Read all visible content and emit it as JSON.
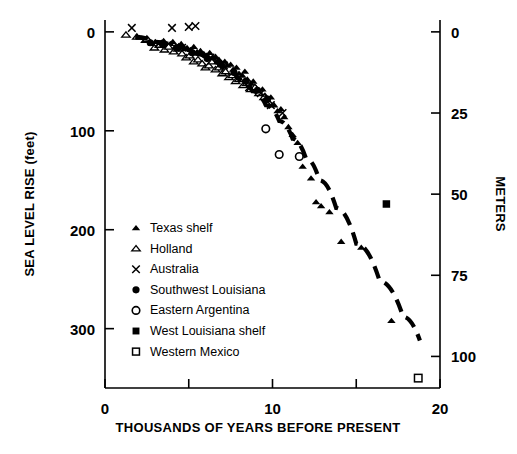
{
  "figure": {
    "left_axis_title": "SEA LEVEL RISE (feet)",
    "right_axis_title": "METERS",
    "x_axis_title": "THOUSANDS OF YEARS BEFORE PRESENT"
  },
  "legend": {
    "items": [
      {
        "label": "Texas shelf",
        "marker": "filled-triangle-icon"
      },
      {
        "label": "Holland",
        "marker": "open-triangle-icon"
      },
      {
        "label": "Australia",
        "marker": "x-cross-icon"
      },
      {
        "label": "Southwest Louisiana",
        "marker": "filled-circle-icon"
      },
      {
        "label": "Eastern Argentina",
        "marker": "open-circle-icon"
      },
      {
        "label": "West Louisiana shelf",
        "marker": "filled-square-icon"
      },
      {
        "label": "Western Mexico",
        "marker": "open-square-icon"
      }
    ]
  },
  "chart_data": {
    "type": "scatter",
    "title": "",
    "xlabel": "THOUSANDS OF YEARS BEFORE PRESENT",
    "ylabel": "SEA LEVEL RISE (feet)",
    "y2label": "METERS",
    "xlim": [
      0,
      20
    ],
    "ylim": [
      360,
      -12
    ],
    "y2lim": [
      110,
      -4
    ],
    "grid": false,
    "legend_position": "inside-lower-left",
    "x_ticks": [
      0,
      5,
      10,
      15,
      20
    ],
    "x_tick_labels": [
      "0",
      "",
      "10",
      "",
      "20"
    ],
    "y_ticks": [
      0,
      100,
      200,
      300
    ],
    "y_tick_labels": [
      "0",
      "100",
      "200",
      "300"
    ],
    "y2_ticks": [
      0,
      25,
      50,
      75,
      100
    ],
    "y2_tick_labels": [
      "0",
      "25",
      "50",
      "75",
      "100"
    ],
    "feet_per_meter": 3.2808,
    "series": [
      {
        "name": "Texas shelf",
        "marker": "filled-triangle",
        "points": [
          [
            2.05,
            6
          ],
          [
            2.35,
            9
          ],
          [
            2.6,
            8
          ],
          [
            2.8,
            12
          ],
          [
            3.0,
            10
          ],
          [
            3.2,
            14
          ],
          [
            3.35,
            11
          ],
          [
            3.5,
            9
          ],
          [
            3.7,
            13
          ],
          [
            3.9,
            12
          ],
          [
            4.05,
            10
          ],
          [
            4.2,
            15
          ],
          [
            4.4,
            14
          ],
          [
            4.55,
            12
          ],
          [
            4.75,
            17
          ],
          [
            4.9,
            16
          ],
          [
            5.1,
            18
          ],
          [
            5.3,
            15
          ],
          [
            5.5,
            20
          ],
          [
            5.7,
            19
          ],
          [
            5.9,
            22
          ],
          [
            6.05,
            24
          ],
          [
            6.25,
            21
          ],
          [
            6.45,
            26
          ],
          [
            6.6,
            25
          ],
          [
            6.8,
            28
          ],
          [
            6.95,
            31
          ],
          [
            7.15,
            30
          ],
          [
            7.3,
            34
          ],
          [
            7.5,
            33
          ],
          [
            7.65,
            38
          ],
          [
            7.85,
            36
          ],
          [
            8.0,
            42
          ],
          [
            8.2,
            44
          ],
          [
            8.35,
            40
          ],
          [
            8.5,
            48
          ],
          [
            8.7,
            52
          ],
          [
            8.85,
            50
          ],
          [
            9.0,
            56
          ],
          [
            9.2,
            60
          ],
          [
            9.4,
            58
          ],
          [
            9.55,
            64
          ],
          [
            9.75,
            70
          ],
          [
            9.9,
            66
          ],
          [
            10.1,
            74
          ],
          [
            10.3,
            80
          ],
          [
            10.5,
            78
          ],
          [
            10.7,
            86
          ],
          [
            10.95,
            96
          ],
          [
            11.2,
            104
          ],
          [
            11.5,
            112
          ],
          [
            11.8,
            136
          ],
          [
            12.3,
            148
          ],
          [
            12.6,
            172
          ],
          [
            12.9,
            176
          ],
          [
            13.4,
            182
          ],
          [
            14.1,
            212
          ],
          [
            15.3,
            218
          ],
          [
            17.1,
            292
          ]
        ]
      },
      {
        "name": "Holland",
        "marker": "open-triangle",
        "points": [
          [
            1.25,
            3
          ],
          [
            1.9,
            5
          ],
          [
            2.5,
            7
          ],
          [
            2.95,
            16
          ],
          [
            3.25,
            13
          ],
          [
            3.55,
            18
          ],
          [
            3.8,
            15
          ],
          [
            4.1,
            20
          ],
          [
            4.35,
            17
          ],
          [
            4.6,
            22
          ],
          [
            4.85,
            26
          ],
          [
            5.05,
            24
          ],
          [
            5.3,
            30
          ],
          [
            5.55,
            28
          ],
          [
            5.8,
            32
          ],
          [
            6.0,
            36
          ],
          [
            6.2,
            34
          ],
          [
            6.4,
            30
          ],
          [
            6.6,
            38
          ],
          [
            6.8,
            36
          ],
          [
            7.0,
            42
          ],
          [
            7.2,
            40
          ],
          [
            7.4,
            46
          ],
          [
            7.6,
            44
          ],
          [
            7.8,
            50
          ],
          [
            8.0,
            48
          ],
          [
            8.25,
            54
          ],
          [
            8.45,
            52
          ],
          [
            8.7,
            58
          ],
          [
            8.95,
            56
          ],
          [
            9.2,
            62
          ],
          [
            9.5,
            66
          ],
          [
            9.8,
            72
          ]
        ]
      },
      {
        "name": "Australia",
        "marker": "x-cross",
        "points": [
          [
            1.6,
            -4
          ],
          [
            4.0,
            -4
          ],
          [
            5.0,
            -5
          ],
          [
            5.4,
            -6
          ],
          [
            3.2,
            12
          ],
          [
            4.6,
            16
          ],
          [
            6.3,
            26
          ],
          [
            7.1,
            34
          ],
          [
            8.6,
            56
          ],
          [
            9.3,
            62
          ],
          [
            9.9,
            74
          ],
          [
            10.6,
            82
          ]
        ]
      },
      {
        "name": "Southwest Louisiana",
        "marker": "filled-circle",
        "points": [
          [
            2.7,
            11
          ],
          [
            3.45,
            13
          ],
          [
            4.3,
            16
          ],
          [
            5.2,
            21
          ],
          [
            6.1,
            27
          ],
          [
            6.9,
            33
          ],
          [
            7.7,
            41
          ],
          [
            8.4,
            50
          ],
          [
            9.1,
            59
          ],
          [
            9.7,
            68
          ]
        ]
      },
      {
        "name": "Eastern Argentina",
        "marker": "open-circle",
        "points": [
          [
            9.6,
            98
          ],
          [
            10.4,
            124
          ],
          [
            11.6,
            126
          ]
        ]
      },
      {
        "name": "West Louisiana shelf",
        "marker": "filled-square",
        "points": [
          [
            16.8,
            174
          ]
        ]
      },
      {
        "name": "Western Mexico",
        "marker": "open-square",
        "points": [
          [
            18.7,
            350
          ]
        ]
      }
    ],
    "trend_line": {
      "style": "dashed",
      "description": "Fitted sea level rise curve",
      "points": [
        [
          1.8,
          5
        ],
        [
          3.0,
          10
        ],
        [
          4.2,
          15
        ],
        [
          5.4,
          22
        ],
        [
          6.4,
          30
        ],
        [
          7.2,
          38
        ],
        [
          8.0,
          48
        ],
        [
          8.8,
          60
        ],
        [
          9.6,
          74
        ],
        [
          10.4,
          90
        ],
        [
          11.2,
          108
        ],
        [
          12.0,
          128
        ],
        [
          12.8,
          150
        ],
        [
          13.8,
          178
        ],
        [
          15.0,
          214
        ],
        [
          16.4,
          252
        ],
        [
          17.8,
          288
        ],
        [
          18.8,
          312
        ]
      ]
    }
  }
}
